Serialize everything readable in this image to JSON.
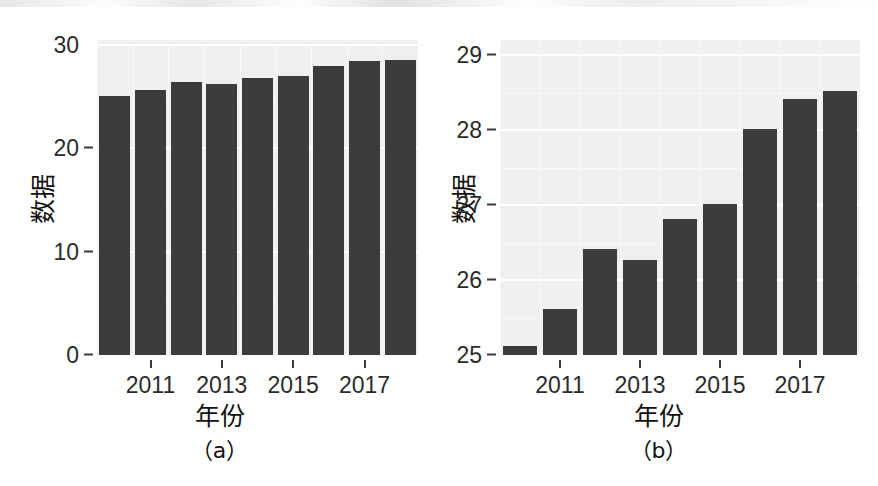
{
  "figure": {
    "subfigures": [
      {
        "caption": "（a）",
        "panel_bg": "#f0f0f0",
        "bar_color": "#3c3c3c"
      },
      {
        "caption": "（b）",
        "panel_bg": "#f0f0f0",
        "bar_color": "#3c3c3c"
      }
    ]
  },
  "chart_data": [
    {
      "type": "bar",
      "title": "",
      "subfigure_label": "（a）",
      "xlabel": "年份",
      "ylabel": "数据",
      "categories": [
        "2010",
        "2011",
        "2012",
        "2013",
        "2014",
        "2015",
        "2016",
        "2017",
        "2018"
      ],
      "values": [
        25.12,
        25.62,
        26.42,
        26.27,
        26.81,
        27.02,
        28.02,
        28.42,
        28.52
      ],
      "ylim": [
        0,
        30.5
      ],
      "yticks": [
        0,
        10,
        20,
        30
      ],
      "ytick_labels": [
        "0",
        "10",
        "20",
        "30"
      ],
      "xticks": [
        "2011",
        "2013",
        "2015",
        "2017"
      ],
      "grid": true,
      "legend": null,
      "bar_color": "#3c3c3c",
      "panel_bg": "#f0f0f0"
    },
    {
      "type": "bar",
      "title": "",
      "subfigure_label": "（b）",
      "xlabel": "年份",
      "ylabel": "数据",
      "categories": [
        "2010",
        "2011",
        "2012",
        "2013",
        "2014",
        "2015",
        "2016",
        "2017",
        "2018"
      ],
      "values": [
        25.12,
        25.62,
        26.42,
        26.27,
        26.81,
        27.02,
        28.02,
        28.42,
        28.52
      ],
      "ylim": [
        25.0,
        29.2
      ],
      "yticks": [
        25,
        26,
        27,
        28,
        29
      ],
      "ytick_labels": [
        "25",
        "26",
        "27",
        "28",
        "29"
      ],
      "xticks": [
        "2011",
        "2013",
        "2015",
        "2017"
      ],
      "grid": true,
      "legend": null,
      "bar_color": "#3c3c3c",
      "panel_bg": "#f0f0f0"
    }
  ]
}
